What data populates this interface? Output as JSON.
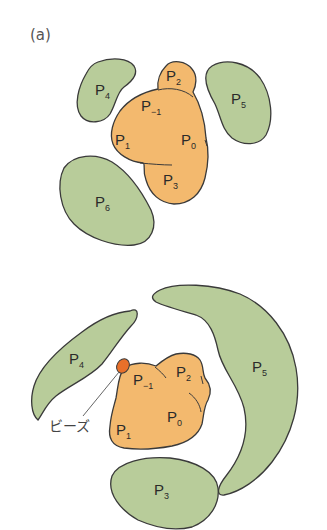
{
  "figure": {
    "panel_label": "(a)",
    "colors": {
      "core_fill": "#F3B96E",
      "domain_fill": "#B8CC9A",
      "outline": "#3a3a3a",
      "bead_fill": "#E8702A",
      "leader_line": "#666666"
    },
    "top_panel": {
      "core_labels": [
        {
          "base": "P",
          "sub": "2"
        },
        {
          "base": "P",
          "sub": "−1"
        },
        {
          "base": "P",
          "sub": "1"
        },
        {
          "base": "P",
          "sub": "0"
        },
        {
          "base": "P",
          "sub": "3"
        }
      ],
      "domain_labels": [
        {
          "base": "P",
          "sub": "4"
        },
        {
          "base": "P",
          "sub": "5"
        },
        {
          "base": "P",
          "sub": "6"
        }
      ]
    },
    "bottom_panel": {
      "core_labels": [
        {
          "base": "P",
          "sub": "−1"
        },
        {
          "base": "P",
          "sub": "2"
        },
        {
          "base": "P",
          "sub": "0"
        },
        {
          "base": "P",
          "sub": "1"
        }
      ],
      "domain_labels": [
        {
          "base": "P",
          "sub": "4"
        },
        {
          "base": "P",
          "sub": "5"
        },
        {
          "base": "P",
          "sub": "3"
        }
      ],
      "bead_label": "ビーズ"
    }
  }
}
